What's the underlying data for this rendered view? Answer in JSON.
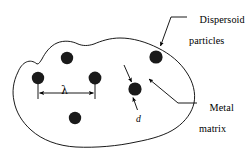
{
  "figure": {
    "kind": "materials-science-schematic",
    "canvas": {
      "width": 246,
      "height": 156
    },
    "colors": {
      "background": "#ffffff",
      "outline": "#000000",
      "particle_fill": "#1a1a1a",
      "text": "#000000",
      "leader": "#000000"
    },
    "labels": {
      "dispersoid": {
        "line1": "Dispersoid",
        "line2": "particles"
      },
      "metal": {
        "line1": "Metal",
        "line2": "matrix"
      },
      "lambda_symbol": "λ",
      "d_symbol": "d"
    },
    "dimension_annotations": [
      {
        "symbol": "λ",
        "meaning": "interparticle spacing",
        "style": "double-headed-horizontal-arrow"
      },
      {
        "symbol": "d",
        "meaning": "particle diameter",
        "style": "leader-arrow"
      }
    ],
    "particles": [
      {
        "id": "p1",
        "cx": 38,
        "cy": 78,
        "r": 6.2
      },
      {
        "id": "p2",
        "cx": 67,
        "cy": 58,
        "r": 6.2
      },
      {
        "id": "p3",
        "cx": 95,
        "cy": 78,
        "r": 6.4
      },
      {
        "id": "p4",
        "cx": 75,
        "cy": 118,
        "r": 6.2
      },
      {
        "id": "p5",
        "cx": 135,
        "cy": 89,
        "r": 6.6
      },
      {
        "id": "p6",
        "cx": 156,
        "cy": 57,
        "r": 6.6
      }
    ],
    "matrix_outline_path": "M 37 64 C 30 58, 22 62, 18 72 C 13 82, 12 92, 14 101 C 16 112, 22 122, 31 130 C 42 140, 58 146, 76 147 C 96 148, 118 146, 136 142 C 152 139, 166 135, 176 128 C 186 121, 192 112, 194 103 C 196 93, 193 82, 187 73 C 180 62, 170 54, 158 48 C 146 42, 133 38, 120 38 C 110 38, 101 41, 94 44 C 88 46, 83 46, 78 44 C 72 41, 64 40, 57 43 C 50 46, 45 53, 42 59 C 40 62, 39 64, 37 64 Z",
    "lambda_dim": {
      "x_left": 38,
      "x_right": 95,
      "y_arrow": 93,
      "tick_top": 84,
      "tick_bottom": 99
    },
    "leaders": {
      "dispersoid": {
        "from_x": 187,
        "from_y": 17,
        "elbow_x": 170,
        "elbow_y": 17,
        "to_x": 159,
        "to_y": 47
      },
      "metal": {
        "from_x": 197,
        "from_y": 103,
        "elbow_x": 176,
        "elbow_y": 103,
        "to_x": 147,
        "to_y": 78
      },
      "d": {
        "from_x": 137,
        "from_y": 110,
        "to_x": 132,
        "to_y": 97
      },
      "unlabeled_top": {
        "from_x": 124,
        "from_y": 65,
        "to_x": 131,
        "to_y": 82
      }
    }
  }
}
